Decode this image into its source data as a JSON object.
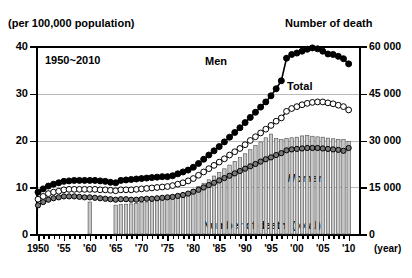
{
  "titles": {
    "left_axis_title": "(per 100,000 population)",
    "right_axis_title": "Number of death",
    "period": "1950~2010",
    "year_unit": "(year)"
  },
  "annotations": {
    "men": "Men",
    "total": "Total",
    "women": "Women",
    "bars": "Number of death (total)"
  },
  "axes": {
    "left_ticks": [
      "40",
      "30",
      "20",
      "10",
      "0"
    ],
    "right_ticks": [
      "60 000",
      "45 000",
      "30 000",
      "15 000",
      "0"
    ],
    "x_ticks": [
      "1950",
      "'55",
      "'60",
      "'65",
      "'70",
      "'75",
      "'80",
      "'85",
      "'90",
      "'95",
      "'00",
      "'05",
      "'10"
    ]
  },
  "colors": {
    "men": "#000000",
    "total": "#ffffff",
    "women": "#7a7a7a",
    "bars": "#c8c8c8",
    "grid": "#b9b9b9",
    "axis": "#000000"
  },
  "chart_data": {
    "type": "line",
    "xlabel": "(year)",
    "ylabel": "(per 100,000 population)",
    "y2label": "Number of death",
    "ylim": [
      0,
      40
    ],
    "y2lim": [
      0,
      60000
    ],
    "xlim": [
      1950,
      2012
    ],
    "grid": true,
    "legend": "inline-annotations",
    "x": [
      1950,
      1951,
      1952,
      1953,
      1954,
      1955,
      1956,
      1957,
      1958,
      1959,
      1960,
      1961,
      1962,
      1963,
      1964,
      1965,
      1966,
      1967,
      1968,
      1969,
      1970,
      1971,
      1972,
      1973,
      1974,
      1975,
      1976,
      1977,
      1978,
      1979,
      1980,
      1981,
      1982,
      1983,
      1984,
      1985,
      1986,
      1987,
      1988,
      1989,
      1990,
      1991,
      1992,
      1993,
      1994,
      1995,
      1996,
      1997,
      1998,
      1999,
      2000,
      2001,
      2002,
      2003,
      2004,
      2005,
      2006,
      2007,
      2008,
      2009,
      2010
    ],
    "series": [
      {
        "name": "Men",
        "marker": "filled-circle",
        "axis": "left",
        "values": [
          8.9,
          9.6,
          10.2,
          10.6,
          10.9,
          11.2,
          11.3,
          11.4,
          11.4,
          11.4,
          11.4,
          11.4,
          11.3,
          11.2,
          11.0,
          10.9,
          11.4,
          11.5,
          11.6,
          11.7,
          11.8,
          11.9,
          12.0,
          12.1,
          12.2,
          12.2,
          12.4,
          12.8,
          13.2,
          13.6,
          14.2,
          15.0,
          15.9,
          16.8,
          17.7,
          18.6,
          19.6,
          20.6,
          21.6,
          22.6,
          23.7,
          24.8,
          25.9,
          27.0,
          28.1,
          29.4,
          30.9,
          32.6,
          37.4,
          38.2,
          38.5,
          38.9,
          39.3,
          39.6,
          39.4,
          38.9,
          38.3,
          38.2,
          37.8,
          37.3,
          36.2
        ]
      },
      {
        "name": "Total",
        "marker": "open-circle",
        "axis": "left",
        "values": [
          7.4,
          8.0,
          8.6,
          8.9,
          9.1,
          9.4,
          9.5,
          9.5,
          9.5,
          9.5,
          9.5,
          9.5,
          9.4,
          9.4,
          9.3,
          9.2,
          9.4,
          9.4,
          9.4,
          9.5,
          9.6,
          9.7,
          9.8,
          9.9,
          10.0,
          10.1,
          10.3,
          10.6,
          10.9,
          11.3,
          11.8,
          12.5,
          13.2,
          13.9,
          14.6,
          15.3,
          16.0,
          16.8,
          17.5,
          18.2,
          19.0,
          19.9,
          20.7,
          21.5,
          22.3,
          23.1,
          24.0,
          24.7,
          26.1,
          26.7,
          27.1,
          27.5,
          27.8,
          28.0,
          28.1,
          28.1,
          27.9,
          27.7,
          27.4,
          27.1,
          26.4
        ]
      },
      {
        "name": "Women",
        "marker": "grey-circle",
        "axis": "left",
        "values": [
          6.1,
          6.8,
          7.3,
          7.6,
          7.8,
          8.0,
          8.0,
          8.0,
          7.9,
          7.8,
          7.8,
          7.7,
          7.6,
          7.5,
          7.4,
          7.3,
          7.4,
          7.4,
          7.3,
          7.3,
          7.4,
          7.5,
          7.5,
          7.6,
          7.7,
          7.8,
          7.9,
          8.1,
          8.3,
          8.6,
          9.0,
          9.4,
          9.9,
          10.4,
          10.9,
          11.4,
          11.9,
          12.4,
          12.9,
          13.4,
          13.9,
          14.4,
          14.9,
          15.4,
          15.9,
          16.3,
          16.8,
          17.2,
          17.8,
          18.0,
          18.1,
          18.2,
          18.3,
          18.3,
          18.3,
          18.2,
          18.1,
          18.0,
          17.9,
          17.7,
          18.3
        ]
      },
      {
        "name": "Number of death (total)",
        "marker": "bar",
        "axis": "right",
        "values": [
          null,
          null,
          null,
          null,
          null,
          null,
          null,
          null,
          null,
          null,
          10200,
          null,
          null,
          null,
          null,
          9200,
          9400,
          9500,
          9600,
          9800,
          10000,
          10200,
          10400,
          10700,
          11000,
          11300,
          11700,
          12200,
          12700,
          13300,
          14100,
          15100,
          16200,
          17300,
          18500,
          19600,
          20800,
          22000,
          23200,
          24400,
          25600,
          26900,
          28200,
          29400,
          30700,
          31900,
          30500,
          30100,
          30500,
          30700,
          30900,
          31300,
          31400,
          31200,
          31000,
          30900,
          30600,
          30400,
          30200,
          30100,
          29600
        ]
      }
    ]
  }
}
